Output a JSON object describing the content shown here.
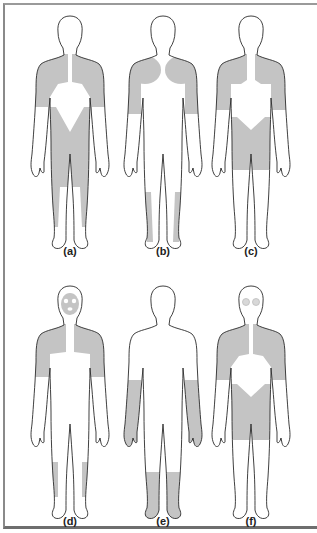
{
  "figure": {
    "shade_color": "#c4c4c4",
    "outline_color": "#2a2a2a",
    "panels": [
      {
        "label": "(a)",
        "regions": [
          "shoulders",
          "upper-arms",
          "chest-upper",
          "hips-thighs",
          "lower-legs-lateral"
        ]
      },
      {
        "label": "(b)",
        "regions": [
          "shoulders",
          "upper-arms",
          "lower-legs-lateral"
        ]
      },
      {
        "label": "(c)",
        "regions": [
          "shoulders",
          "upper-arms",
          "chest-upper",
          "hips-thighs"
        ]
      },
      {
        "label": "(d)",
        "regions": [
          "face",
          "shoulders",
          "upper-arms",
          "chest-upper",
          "lower-legs-lateral"
        ]
      },
      {
        "label": "(e)",
        "regions": [
          "forearms",
          "lower-legs",
          "feet"
        ]
      },
      {
        "label": "(f)",
        "regions": [
          "eyes",
          "shoulders",
          "upper-arms",
          "chest-upper",
          "hips-thighs"
        ]
      }
    ]
  }
}
